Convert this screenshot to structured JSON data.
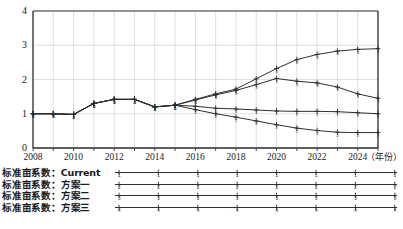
{
  "chart_data": {
    "type": "line",
    "title": "",
    "xlabel": "（年份）",
    "ylabel": "",
    "xlim": [
      2008,
      2025
    ],
    "ylim": [
      0,
      4
    ],
    "grid": true,
    "legend_position": "below",
    "x": [
      2008,
      2009,
      2010,
      2011,
      2012,
      2013,
      2014,
      2015,
      2016,
      2017,
      2018,
      2019,
      2020,
      2021,
      2022,
      2023,
      2024,
      2025
    ],
    "xtick_labels": [
      "2008",
      "2010",
      "2012",
      "2014",
      "2016",
      "2018",
      "2020",
      "2022",
      "2024"
    ],
    "xtick_values": [
      2008,
      2010,
      2012,
      2014,
      2016,
      2018,
      2020,
      2022,
      2024
    ],
    "ytick_labels": [
      "0",
      "1",
      "2",
      "3",
      "4"
    ],
    "ytick_values": [
      0,
      1,
      2,
      3,
      4
    ],
    "series": [
      {
        "name": "标准亩系数：Current",
        "marker": "1",
        "values": [
          1.0,
          1.0,
          0.98,
          1.3,
          1.42,
          1.42,
          1.2,
          1.25,
          1.22,
          1.16,
          1.14,
          1.11,
          1.08,
          1.07,
          1.07,
          1.06,
          1.03,
          1.0
        ]
      },
      {
        "name": "标准亩系数：方案一",
        "marker": "2",
        "values": [
          1.0,
          1.0,
          0.98,
          1.3,
          1.42,
          1.42,
          1.2,
          1.25,
          1.12,
          1.0,
          0.9,
          0.79,
          0.68,
          0.58,
          0.51,
          0.46,
          0.45,
          0.45
        ]
      },
      {
        "name": "标准亩系数：方案二",
        "marker": "3",
        "values": [
          1.0,
          1.0,
          0.98,
          1.3,
          1.42,
          1.42,
          1.2,
          1.25,
          1.4,
          1.55,
          1.68,
          1.85,
          2.03,
          1.95,
          1.9,
          1.78,
          1.58,
          1.45
        ]
      },
      {
        "name": "标准亩系数：方案三",
        "marker": "4",
        "values": [
          1.0,
          1.0,
          0.98,
          1.3,
          1.42,
          1.42,
          1.2,
          1.25,
          1.42,
          1.58,
          1.72,
          2.02,
          2.32,
          2.58,
          2.73,
          2.83,
          2.88,
          2.9
        ]
      }
    ]
  },
  "legend": {
    "items": [
      {
        "label": "标准亩系数：Current",
        "marker": "1"
      },
      {
        "label": "标准亩系数：方案一",
        "marker": "2"
      },
      {
        "label": "标准亩系数：方案二",
        "marker": "3"
      },
      {
        "label": "标准亩系数：方案三",
        "marker": "4"
      }
    ]
  },
  "axis": {
    "x_unit_label": "（年份）"
  },
  "caption": ""
}
